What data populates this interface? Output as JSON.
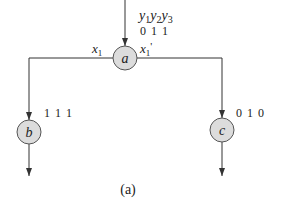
{
  "diagram": {
    "caption": "(a)",
    "colors": {
      "node_fill": "#dcdcdc",
      "node_stroke": "#555555",
      "wire": "#333333",
      "text": "#222222"
    },
    "header": {
      "variables": [
        "y",
        "y",
        "y"
      ],
      "subscripts": [
        "1",
        "2",
        "3"
      ]
    },
    "nodes": [
      {
        "id": "a",
        "label": "a",
        "code": "0 1 1"
      },
      {
        "id": "b",
        "label": "b",
        "code": "1 1 1"
      },
      {
        "id": "c",
        "label": "c",
        "code": "0 1 0"
      }
    ],
    "edges": [
      {
        "from": "a",
        "to": "b",
        "label_var": "x",
        "label_sub": "1",
        "label_prime": ""
      },
      {
        "from": "a",
        "to": "c",
        "label_var": "x",
        "label_sub": "1",
        "label_prime": "'"
      }
    ]
  }
}
